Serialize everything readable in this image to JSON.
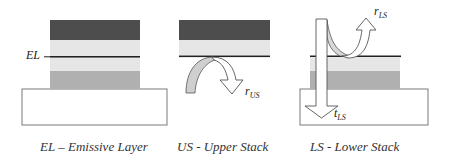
{
  "colors": {
    "dark_layer": "#4d4d4d",
    "light_layer": "#e6e6e6",
    "mid_layer": "#b0b0b0",
    "el_line": "#222222",
    "substrate_fill": "#ffffff",
    "substrate_stroke": "#7a7a7a",
    "arrow_gray": "#cfcfcf"
  },
  "panels": [
    {
      "id": "el",
      "side_label": "EL",
      "caption": "EL – Emissive Layer"
    },
    {
      "id": "us",
      "arrow_label_main": "r",
      "arrow_label_sub": "US",
      "caption": "US - Upper Stack"
    },
    {
      "id": "ls",
      "reflect_label_main": "r",
      "reflect_label_sub": "LS",
      "transmit_label_main": "t",
      "transmit_label_sub": "LS",
      "caption": "LS - Lower Stack"
    }
  ]
}
